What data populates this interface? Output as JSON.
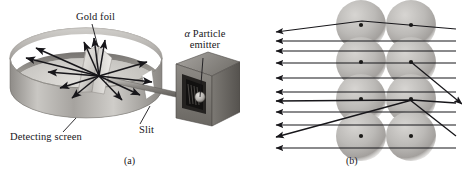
{
  "figure": {
    "panels": [
      {
        "id": "a",
        "caption": "(a)",
        "description": "Apparatus: alpha particle emitter, slit, gold foil, cylindrical detecting screen",
        "labels": [
          {
            "name": "gold-foil",
            "text": "Gold foil"
          },
          {
            "name": "alpha-particle-emitter",
            "text_italic": "α",
            "text": " Particle",
            "text_line2": "emitter"
          },
          {
            "name": "detecting-screen",
            "text": "Detecting screen"
          },
          {
            "name": "slit",
            "text": "Slit"
          }
        ]
      },
      {
        "id": "b",
        "caption": "(b)",
        "description": "Atomic model: grid of gold atoms with dense nuclei; alpha rays mostly pass straight, a few deflect",
        "atom_grid": {
          "columns": 2,
          "rows": 4,
          "nucleus_visible": true
        }
      }
    ],
    "colors": {
      "ink": "#17161a",
      "metal_light": "#d8d6d2",
      "metal_mid": "#a9a6a2",
      "metal_dark": "#6e6b68",
      "atom_fill": "#b9b7b4",
      "nucleus": "#1b1a18",
      "background": "#ffffff"
    }
  }
}
